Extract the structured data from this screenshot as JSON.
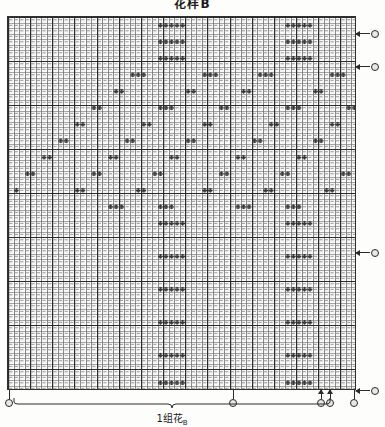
{
  "title": "花样B",
  "grid": {
    "cols": 63,
    "rows": 68,
    "cell_w": 5.54,
    "cell_h": 5.5,
    "line_color": "#6e6e6e",
    "major_line_color": "#2b2b2b",
    "symbol_color": "#3a3a3a",
    "background": "#ffffff",
    "major_every_cols": 4,
    "major_every_rows": 8
  },
  "row_markers": [
    {
      "name": "row-marker-top-1",
      "y": 17,
      "symbol": "arrow-left-circle"
    },
    {
      "name": "row-marker-top-2",
      "y": 50,
      "symbol": "arrow-left-circle"
    },
    {
      "name": "row-marker-mid",
      "y": 236,
      "symbol": "arrow-left-circle"
    },
    {
      "name": "row-marker-bottom",
      "y": 374,
      "symbol": "arrow-left-circle"
    }
  ],
  "col_markers": [
    {
      "name": "col-marker-left",
      "x": 9,
      "arrow": false
    },
    {
      "name": "col-marker-repeat-a",
      "x": 233,
      "arrow": false
    },
    {
      "name": "col-marker-repeat-b",
      "x": 321,
      "arrow": true
    },
    {
      "name": "col-marker-repeat-c",
      "x": 330,
      "arrow": true
    },
    {
      "name": "col-marker-right",
      "x": 354,
      "arrow": false
    }
  ],
  "repeat": {
    "label": "1组花",
    "sublabel": "B",
    "start_x": 14,
    "end_x": 330,
    "bracket_y": 404,
    "label_y": 410
  },
  "chart_data": {
    "type": "heatmap",
    "title": "花样B",
    "xlabel": "",
    "ylabel": "",
    "cols": 63,
    "rows": 68,
    "legend": [
      "1组花"
    ],
    "motifs": [
      {
        "name": "flower-diamond",
        "cx": 0.285,
        "cy": 0.27
      },
      {
        "name": "flower-diamond",
        "cx": 0.715,
        "cy": 0.27
      },
      {
        "name": "flower-diamond",
        "cx": 0.285,
        "cy": 0.62
      },
      {
        "name": "flower-diamond",
        "cx": 0.715,
        "cy": 0.62
      },
      {
        "name": "flower-diamond",
        "cx": 0.5,
        "cy": 0.45
      },
      {
        "name": "flower-diamond",
        "cx": 0.07,
        "cy": 0.45
      },
      {
        "name": "flower-diamond",
        "cx": 0.93,
        "cy": 0.45
      }
    ],
    "symbol_cells": [
      [
        27,
        1
      ],
      [
        28,
        1
      ],
      [
        29,
        1
      ],
      [
        30,
        1
      ],
      [
        31,
        1
      ],
      [
        50,
        1
      ],
      [
        51,
        1
      ],
      [
        52,
        1
      ],
      [
        53,
        1
      ],
      [
        54,
        1
      ],
      [
        27,
        4
      ],
      [
        28,
        4
      ],
      [
        29,
        4
      ],
      [
        30,
        4
      ],
      [
        31,
        4
      ],
      [
        50,
        4
      ],
      [
        51,
        4
      ],
      [
        52,
        4
      ],
      [
        53,
        4
      ],
      [
        54,
        4
      ],
      [
        27,
        7
      ],
      [
        28,
        7
      ],
      [
        29,
        7
      ],
      [
        30,
        7
      ],
      [
        31,
        7
      ],
      [
        50,
        7
      ],
      [
        51,
        7
      ],
      [
        52,
        7
      ],
      [
        53,
        7
      ],
      [
        54,
        7
      ],
      [
        22,
        10
      ],
      [
        23,
        10
      ],
      [
        24,
        10
      ],
      [
        35,
        10
      ],
      [
        36,
        10
      ],
      [
        37,
        10
      ],
      [
        45,
        10
      ],
      [
        46,
        10
      ],
      [
        47,
        10
      ],
      [
        58,
        10
      ],
      [
        59,
        10
      ],
      [
        60,
        10
      ],
      [
        19,
        13
      ],
      [
        20,
        13
      ],
      [
        32,
        13
      ],
      [
        33,
        13
      ],
      [
        42,
        13
      ],
      [
        43,
        13
      ],
      [
        55,
        13
      ],
      [
        56,
        13
      ],
      [
        15,
        16
      ],
      [
        16,
        16
      ],
      [
        27,
        16
      ],
      [
        28,
        16
      ],
      [
        29,
        16
      ],
      [
        38,
        16
      ],
      [
        39,
        16
      ],
      [
        50,
        16
      ],
      [
        51,
        16
      ],
      [
        52,
        16
      ],
      [
        61,
        16
      ],
      [
        62,
        16
      ],
      [
        12,
        19
      ],
      [
        13,
        19
      ],
      [
        24,
        19
      ],
      [
        25,
        19
      ],
      [
        35,
        19
      ],
      [
        36,
        19
      ],
      [
        47,
        19
      ],
      [
        48,
        19
      ],
      [
        58,
        19
      ],
      [
        59,
        19
      ],
      [
        9,
        22
      ],
      [
        10,
        22
      ],
      [
        21,
        22
      ],
      [
        22,
        22
      ],
      [
        32,
        22
      ],
      [
        33,
        22
      ],
      [
        44,
        22
      ],
      [
        45,
        22
      ],
      [
        55,
        22
      ],
      [
        56,
        22
      ],
      [
        6,
        25
      ],
      [
        7,
        25
      ],
      [
        18,
        25
      ],
      [
        19,
        25
      ],
      [
        29,
        25
      ],
      [
        30,
        25
      ],
      [
        41,
        25
      ],
      [
        42,
        25
      ],
      [
        52,
        25
      ],
      [
        53,
        25
      ],
      [
        3,
        28
      ],
      [
        4,
        28
      ],
      [
        15,
        28
      ],
      [
        16,
        28
      ],
      [
        26,
        28
      ],
      [
        27,
        28
      ],
      [
        38,
        28
      ],
      [
        39,
        28
      ],
      [
        49,
        28
      ],
      [
        50,
        28
      ],
      [
        60,
        28
      ],
      [
        61,
        28
      ],
      [
        1,
        31
      ],
      [
        12,
        31
      ],
      [
        13,
        31
      ],
      [
        23,
        31
      ],
      [
        24,
        31
      ],
      [
        35,
        31
      ],
      [
        36,
        31
      ],
      [
        46,
        31
      ],
      [
        47,
        31
      ],
      [
        57,
        31
      ],
      [
        58,
        31
      ],
      [
        18,
        34
      ],
      [
        19,
        34
      ],
      [
        20,
        34
      ],
      [
        27,
        34
      ],
      [
        28,
        34
      ],
      [
        29,
        34
      ],
      [
        41,
        34
      ],
      [
        42,
        34
      ],
      [
        43,
        34
      ],
      [
        50,
        34
      ],
      [
        51,
        34
      ],
      [
        52,
        34
      ],
      [
        27,
        37
      ],
      [
        28,
        37
      ],
      [
        29,
        37
      ],
      [
        30,
        37
      ],
      [
        31,
        37
      ],
      [
        50,
        37
      ],
      [
        51,
        37
      ],
      [
        52,
        37
      ],
      [
        53,
        37
      ],
      [
        54,
        37
      ],
      [
        27,
        43
      ],
      [
        28,
        43
      ],
      [
        29,
        43
      ],
      [
        30,
        43
      ],
      [
        31,
        43
      ],
      [
        50,
        43
      ],
      [
        51,
        43
      ],
      [
        52,
        43
      ],
      [
        53,
        43
      ],
      [
        54,
        43
      ],
      [
        27,
        49
      ],
      [
        28,
        49
      ],
      [
        29,
        49
      ],
      [
        30,
        49
      ],
      [
        31,
        49
      ],
      [
        50,
        49
      ],
      [
        51,
        49
      ],
      [
        52,
        49
      ],
      [
        53,
        49
      ],
      [
        54,
        49
      ],
      [
        27,
        55
      ],
      [
        28,
        55
      ],
      [
        29,
        55
      ],
      [
        30,
        55
      ],
      [
        31,
        55
      ],
      [
        50,
        55
      ],
      [
        51,
        55
      ],
      [
        52,
        55
      ],
      [
        53,
        55
      ],
      [
        54,
        55
      ],
      [
        27,
        61
      ],
      [
        28,
        61
      ],
      [
        29,
        61
      ],
      [
        30,
        61
      ],
      [
        31,
        61
      ],
      [
        50,
        61
      ],
      [
        51,
        61
      ],
      [
        52,
        61
      ],
      [
        53,
        61
      ],
      [
        54,
        61
      ],
      [
        27,
        66
      ],
      [
        28,
        66
      ],
      [
        29,
        66
      ],
      [
        30,
        66
      ],
      [
        31,
        66
      ],
      [
        50,
        66
      ],
      [
        51,
        66
      ],
      [
        52,
        66
      ],
      [
        53,
        66
      ],
      [
        54,
        66
      ]
    ]
  }
}
